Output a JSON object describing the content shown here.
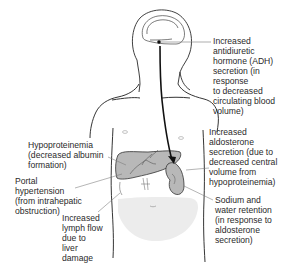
{
  "diagram": {
    "type": "anatomical-illustration",
    "colors": {
      "outline": "#1a1a1a",
      "organ_fill": "#b8b8b8",
      "abdomen_fill": "#ececec",
      "leader_line": "#777777",
      "text": "#2a2a2a"
    },
    "labels": {
      "adh": "Increased antidiuretic\nhormone (ADH)\nsecretion (in response\nto decreased\ncirculating blood\nvolume)",
      "aldosterone": "Increased\naldosterone\nsecretion (due to\ndecreased central\nvolume from\nhypoproteinemia)",
      "sodium": "Sodium and\nwater retention\n(in response to\naldosterone\nsecretion)",
      "hypoproteinemia": "Hypoproteinemia\n(decreased albumin\nformation)",
      "portal": "Portal\nhypertension\n(from intrahepatic\nobstruction)",
      "lymph": "Increased\nlymph flow\ndue to\nliver\ndamage"
    }
  }
}
